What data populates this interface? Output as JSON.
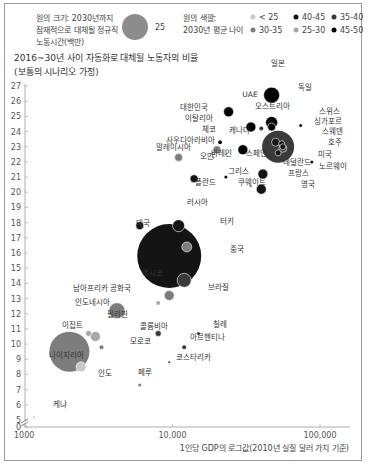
{
  "legend": {
    "size_title_lines": [
      "원의 크기: 2030년까지",
      "잠재적으로 대체될 정규직",
      "노동시간(백만)"
    ],
    "size_sample_value": "25",
    "color_title_lines": [
      "원의 색깔:",
      "2030년 평균 나이"
    ],
    "color_items": [
      {
        "label": "< 25",
        "color": "#c9c9c9"
      },
      {
        "label": "25-30",
        "color": "#a8a8a8"
      },
      {
        "label": "30-35",
        "color": "#7d7d7d"
      },
      {
        "label": "35-40",
        "color": "#3a3a3a"
      },
      {
        "label": "40-45",
        "color": "#141414"
      },
      {
        "label": "45-50",
        "color": "#000000"
      }
    ]
  },
  "chart_data": {
    "type": "scatter",
    "title": "2016~30년 사이 자동화로 대체될 노동자의 비율",
    "subtitle": "(보통의 시나리오 가정)",
    "xlabel": "1인당 GDP의 로그값(2010년 실질 달러 가치 기준)",
    "ylabel": "",
    "x_scale": "log",
    "xlim": [
      1000,
      150000
    ],
    "ylim": [
      0,
      27
    ],
    "y_break": [
      0,
      5
    ],
    "x_ticks": [
      "1000",
      "10,000",
      "100,000"
    ],
    "y_ticks": [
      "0",
      "5",
      "6",
      "7",
      "8",
      "9",
      "10",
      "11",
      "12",
      "13",
      "14",
      "15",
      "16",
      "17",
      "18",
      "19",
      "20",
      "21",
      "22",
      "23",
      "24",
      "25",
      "26",
      "27"
    ],
    "grid": false,
    "legend_position": "top",
    "points": [
      {
        "name": "일본",
        "gdp": 47000,
        "y": 26.4,
        "r": 8,
        "age": "45-50"
      },
      {
        "name": "독일",
        "gdp": 47000,
        "y": 24.6,
        "r": 6,
        "age": "45-50"
      },
      {
        "name": "UAE",
        "gdp": 40000,
        "y": 24.2,
        "r": 2,
        "age": "35-40"
      },
      {
        "name": "오스트리아",
        "gdp": 47000,
        "y": 24.3,
        "r": 4,
        "age": "45-50"
      },
      {
        "name": "스위스",
        "gdp": 74000,
        "y": 24.4,
        "r": 1.5,
        "age": "40-45"
      },
      {
        "name": "대한민국",
        "gdp": 24000,
        "y": 25.3,
        "r": 5,
        "age": "45-50"
      },
      {
        "name": "이탈리아",
        "gdp": 34000,
        "y": 24.3,
        "r": 5,
        "age": "45-50"
      },
      {
        "name": "체코",
        "gdp": 21000,
        "y": 23.3,
        "r": 2,
        "age": "40-45"
      },
      {
        "name": "캐나다",
        "gdp": 50000,
        "y": 23.3,
        "r": 4,
        "age": "40-45"
      },
      {
        "name": "싱가포르",
        "gdp": 55000,
        "y": 23.2,
        "r": 3,
        "age": "40-45"
      },
      {
        "name": "스웨덴",
        "gdp": 56000,
        "y": 23.0,
        "r": 3,
        "age": "40-45"
      },
      {
        "name": "호주",
        "gdp": 56000,
        "y": 22.9,
        "r": 4,
        "age": "35-40"
      },
      {
        "name": "미국",
        "gdp": 52000,
        "y": 23.0,
        "r": 16,
        "age": "35-40"
      },
      {
        "name": "노르웨이",
        "gdp": 88000,
        "y": 22.0,
        "r": 1.5,
        "age": "40-45"
      },
      {
        "name": "사우디아라비아",
        "gdp": 20000,
        "y": 22.8,
        "r": 4,
        "age": "30-35"
      },
      {
        "name": "말레이시아",
        "gdp": 11000,
        "y": 22.3,
        "r": 4,
        "age": "30-35"
      },
      {
        "name": "오만",
        "gdp": 19000,
        "y": 22.3,
        "r": 1,
        "age": "30-35"
      },
      {
        "name": "바레인",
        "gdp": 23000,
        "y": 22.5,
        "r": 1,
        "age": "30-35"
      },
      {
        "name": "스페인",
        "gdp": 30000,
        "y": 22.8,
        "r": 5,
        "age": "45-50"
      },
      {
        "name": "네덜란드",
        "gdp": 52000,
        "y": 22.6,
        "r": 3,
        "age": "40-45"
      },
      {
        "name": "프랑스",
        "gdp": 41000,
        "y": 21.2,
        "r": 5,
        "age": "40-45"
      },
      {
        "name": "그리스",
        "gdp": 23000,
        "y": 21.0,
        "r": 1.5,
        "age": "45-50"
      },
      {
        "name": "폴란드",
        "gdp": 14000,
        "y": 20.9,
        "r": 4,
        "age": "40-45"
      },
      {
        "name": "쿠웨이트",
        "gdp": 34000,
        "y": 20.4,
        "r": 1,
        "age": "30-35"
      },
      {
        "name": "영국",
        "gdp": 40000,
        "y": 20.2,
        "r": 5,
        "age": "40-45"
      },
      {
        "name": "러시아",
        "gdp": 11000,
        "y": 17.8,
        "r": 6,
        "age": "40-45"
      },
      {
        "name": "태국",
        "gdp": 6000,
        "y": 17.8,
        "r": 4,
        "age": "40-45"
      },
      {
        "name": "터키",
        "gdp": 12500,
        "y": 16.4,
        "r": 5,
        "age": "30-35"
      },
      {
        "name": "중국",
        "gdp": 9500,
        "y": 15.8,
        "r": 32,
        "age": "40-45"
      },
      {
        "name": "브라질",
        "gdp": 12000,
        "y": 14.2,
        "r": 7,
        "age": "35-40"
      },
      {
        "name": "멕시코",
        "gdp": 9500,
        "y": 13.2,
        "r": 5,
        "age": "30-35"
      },
      {
        "name": "남아프리카 공화국",
        "gdp": 8000,
        "y": 12.7,
        "r": 2,
        "age": "25-30"
      },
      {
        "name": "인도네시아",
        "gdp": 4200,
        "y": 12.2,
        "r": 8,
        "age": "30-35"
      },
      {
        "name": "필리핀",
        "gdp": 3000,
        "y": 10.5,
        "r": 5,
        "age": "25-30"
      },
      {
        "name": "이집트",
        "gdp": 2700,
        "y": 10.7,
        "r": 3,
        "age": "25-30"
      },
      {
        "name": "모로코",
        "gdp": 3300,
        "y": 9.8,
        "r": 2,
        "age": "30-35"
      },
      {
        "name": "인도",
        "gdp": 2000,
        "y": 9.5,
        "r": 20,
        "age": "30-35"
      },
      {
        "name": "나이지리아",
        "gdp": 2400,
        "y": 8.5,
        "r": 5,
        "age": "< 25"
      },
      {
        "name": "콜롬비아",
        "gdp": 8000,
        "y": 10.7,
        "r": 3,
        "age": "35-40"
      },
      {
        "name": "칠레",
        "gdp": 15000,
        "y": 10.7,
        "r": 1.5,
        "age": "35-40"
      },
      {
        "name": "아르헨티나",
        "gdp": 12000,
        "y": 9.8,
        "r": 2,
        "age": "35-40"
      },
      {
        "name": "코스타리카",
        "gdp": 9500,
        "y": 8.8,
        "r": 1,
        "age": "35-40"
      },
      {
        "name": "페루",
        "gdp": 6000,
        "y": 7.3,
        "r": 1.5,
        "age": "30-35"
      },
      {
        "name": "케냐",
        "gdp": 1150,
        "y": 5.2,
        "r": 1,
        "age": "< 25"
      }
    ]
  },
  "labels": [
    {
      "text": "일본",
      "x": 278,
      "y": 66
    },
    {
      "text": "UAE",
      "x": 250,
      "y": 97
    },
    {
      "text": "오스트리아",
      "x": 272,
      "y": 109
    },
    {
      "text": "독일",
      "x": 305,
      "y": 90
    },
    {
      "text": "스위스",
      "x": 329,
      "y": 114
    },
    {
      "text": "싱가포르",
      "x": 328,
      "y": 124
    },
    {
      "text": "스웨덴",
      "x": 332,
      "y": 134
    },
    {
      "text": "호주",
      "x": 335,
      "y": 145
    },
    {
      "text": "미국",
      "x": 325,
      "y": 157
    },
    {
      "text": "노르웨이",
      "x": 333,
      "y": 169
    },
    {
      "text": "대한민국",
      "x": 194,
      "y": 110
    },
    {
      "text": "이탈리아",
      "x": 199,
      "y": 121
    },
    {
      "text": "체코",
      "x": 209,
      "y": 132
    },
    {
      "text": "캐나다",
      "x": 239,
      "y": 133
    },
    {
      "text": "사우디아라비아",
      "x": 190,
      "y": 143
    },
    {
      "text": "말레이시아",
      "x": 173,
      "y": 150
    },
    {
      "text": "오만",
      "x": 207,
      "y": 159
    },
    {
      "text": "바레인",
      "x": 221,
      "y": 156
    },
    {
      "text": "스페인",
      "x": 256,
      "y": 156
    },
    {
      "text": "네덜란드",
      "x": 297,
      "y": 165
    },
    {
      "text": "프랑스",
      "x": 298,
      "y": 176
    },
    {
      "text": "그리스",
      "x": 238,
      "y": 174
    },
    {
      "text": "폴란드",
      "x": 205,
      "y": 185
    },
    {
      "text": "쿠웨이트",
      "x": 252,
      "y": 185
    },
    {
      "text": "영국",
      "x": 308,
      "y": 187
    },
    {
      "text": "러시아",
      "x": 197,
      "y": 205
    },
    {
      "text": "태국",
      "x": 143,
      "y": 226
    },
    {
      "text": "터키",
      "x": 227,
      "y": 224
    },
    {
      "text": "중국",
      "x": 237,
      "y": 252
    },
    {
      "text": "멕시코",
      "x": 152,
      "y": 276
    },
    {
      "text": "브라질",
      "x": 218,
      "y": 290
    },
    {
      "text": "남아프리카 공화국",
      "x": 102,
      "y": 291
    },
    {
      "text": "인도네시아",
      "x": 92,
      "y": 305
    },
    {
      "text": "필리핀",
      "x": 117,
      "y": 317
    },
    {
      "text": "이집트",
      "x": 72,
      "y": 328
    },
    {
      "text": "모로코",
      "x": 140,
      "y": 344
    },
    {
      "text": "나이지리아",
      "x": 66,
      "y": 358
    },
    {
      "text": "인도",
      "x": 105,
      "y": 376
    },
    {
      "text": "콜롬비아",
      "x": 154,
      "y": 329
    },
    {
      "text": "칠레",
      "x": 220,
      "y": 327
    },
    {
      "text": "아르헨티나",
      "x": 207,
      "y": 340
    },
    {
      "text": "코스타리카",
      "x": 193,
      "y": 360
    },
    {
      "text": "페루",
      "x": 145,
      "y": 375
    },
    {
      "text": "케냐",
      "x": 60,
      "y": 407
    }
  ]
}
